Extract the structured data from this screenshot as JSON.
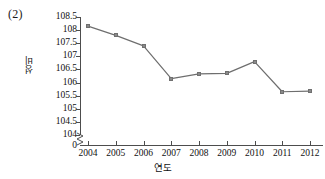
{
  "figure": {
    "index_label": "(2)"
  },
  "chart_data": {
    "type": "line",
    "title": "",
    "xlabel": "연도",
    "ylabel": "성비",
    "categories": [
      "2004",
      "2005",
      "2006",
      "2007",
      "2008",
      "2009",
      "2010",
      "2011",
      "2012"
    ],
    "x": [
      2004,
      2005,
      2006,
      2007,
      2008,
      2009,
      2010,
      2011,
      2012
    ],
    "values": [
      108.15,
      107.8,
      107.4,
      106.15,
      106.33,
      106.35,
      106.8,
      105.65,
      105.67
    ],
    "series": [
      {
        "name": "성비",
        "values": [
          108.15,
          107.8,
          107.4,
          106.15,
          106.33,
          106.35,
          106.8,
          105.65,
          105.67
        ],
        "color": "#6e6e6e",
        "marker": "square"
      }
    ],
    "ylim": [
      104,
      108.5
    ],
    "xlim": [
      2004,
      2012
    ],
    "ytick_labels": [
      "108.5",
      "108",
      "107.5",
      "107",
      "106.5",
      "106",
      "105.5",
      "105",
      "104.5",
      "104"
    ],
    "yticks": [
      108.5,
      108,
      107.5,
      107,
      106.5,
      106,
      105.5,
      105,
      104.5,
      104
    ],
    "y_origin_label": "0",
    "axis_break": true,
    "grid": false,
    "legend": "none",
    "line_color": "#6e6e6e",
    "marker_color": "#8a8a8a",
    "axis_color": "#4d4d4d"
  }
}
